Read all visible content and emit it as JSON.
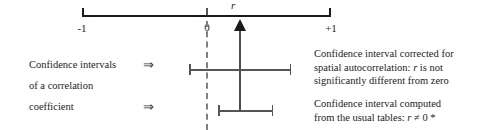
{
  "diagram": {
    "axis": {
      "variable_label": "r",
      "ticks": [
        {
          "label": "-1",
          "value": -1
        },
        {
          "label": "0",
          "value": 0
        },
        {
          "label": "+1",
          "value": 1
        }
      ]
    },
    "left_caption": {
      "lines": [
        "Confidence intervals",
        "of a correlation",
        "coefficient"
      ],
      "arrow_glyph": "⇒"
    },
    "intervals": [
      {
        "id": "corrected",
        "lower": -0.17,
        "upper": 0.85,
        "note_lines": [
          "Confidence interval corrected for",
          "spatial autocorrelation: ",
          "r",
          " is not",
          "significantly different from zero"
        ]
      },
      {
        "id": "usual-tables",
        "lower": 0.12,
        "upper": 0.56,
        "note_lines": [
          "Confidence interval computed",
          "from the usual tables: ",
          "r",
          " ≠ 0 *"
        ]
      }
    ],
    "notes": {
      "note1_line1": "Confidence interval corrected for",
      "note1_line2a": "spatial autocorrelation: ",
      "note1_line2b": "r",
      "note1_line2c": " is not",
      "note1_line3": "significantly different from zero",
      "note2_line1": "Confidence interval computed",
      "note2_line2a": "from the usual tables: ",
      "note2_line2b": "r",
      "note2_line2c": " ≠ 0 *"
    },
    "estimate_marker": {
      "name": "observed-r-arrow",
      "value": 0.34
    }
  }
}
